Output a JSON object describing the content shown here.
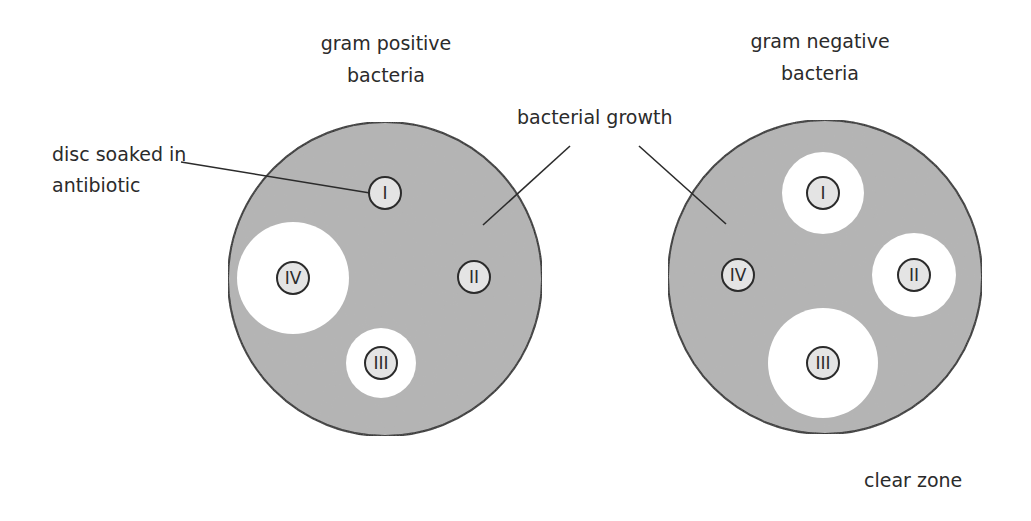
{
  "colors": {
    "growth": "#b4b4b4",
    "clear_zone": "#ffffff",
    "disc_fill": "#e4e4e4",
    "outline": "#2b2b2b",
    "text": "#2b2b2b"
  },
  "labels": {
    "disc": [
      "disc soaked in",
      "antibiotic"
    ],
    "growth": "bacterial growth",
    "clear_zone": "clear zone"
  },
  "plates": [
    {
      "title": [
        "gram positive",
        "bacteria"
      ],
      "cx": 385,
      "cy": 279,
      "r": 157,
      "discs": [
        {
          "label": "I",
          "cx": 385,
          "cy": 193,
          "zone_r": 0
        },
        {
          "label": "II",
          "cx": 474,
          "cy": 277,
          "zone_r": 0
        },
        {
          "label": "III",
          "cx": 381,
          "cy": 363,
          "zone_r": 35
        },
        {
          "label": "IV",
          "cx": 293,
          "cy": 278,
          "zone_r": 56
        }
      ]
    },
    {
      "title": [
        "gram negative",
        "bacteria"
      ],
      "cx": 825,
      "cy": 277,
      "r": 157,
      "discs": [
        {
          "label": "I",
          "cx": 823,
          "cy": 193,
          "zone_r": 41
        },
        {
          "label": "II",
          "cx": 914,
          "cy": 275,
          "zone_r": 42
        },
        {
          "label": "III",
          "cx": 823,
          "cy": 363,
          "zone_r": 55
        },
        {
          "label": "IV",
          "cx": 738,
          "cy": 275,
          "zone_r": 0
        }
      ]
    }
  ]
}
